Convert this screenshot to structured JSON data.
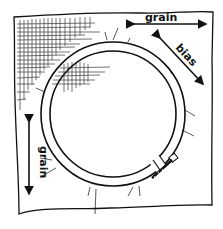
{
  "figure": {
    "colors": {
      "ink": "#111111",
      "paper": "#ffffff",
      "hatch": "#222222"
    },
    "labels": {
      "grain_top": "grain",
      "bias": "bias",
      "grain_left": "grain"
    },
    "arrows": [
      {
        "name": "grain-horizontal",
        "label_key": "grain_top",
        "direction": "horizontal",
        "double_headed": true
      },
      {
        "name": "bias-diagonal",
        "label_key": "bias",
        "direction": "diagonal",
        "double_headed": true
      },
      {
        "name": "grain-vertical",
        "label_key": "grain_left",
        "direction": "vertical",
        "double_headed": true
      }
    ],
    "hoop": {
      "has_screw_clamp": true,
      "clamp_position": "lower-right"
    }
  }
}
